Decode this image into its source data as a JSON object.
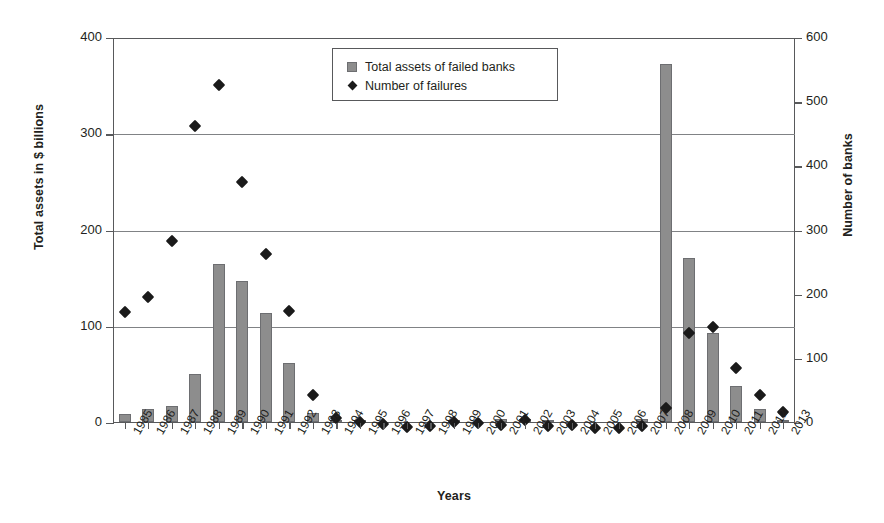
{
  "chart_data": {
    "type": "bar",
    "title": "",
    "xlabel": "Years",
    "ylabel": "Total assets in $ billions",
    "ylabel_right": "Number of banks",
    "ylim": [
      0,
      400
    ],
    "ylim_right": [
      0,
      600
    ],
    "yticks": [
      0,
      100,
      200,
      300,
      400
    ],
    "yticks_right": [
      0,
      100,
      200,
      300,
      400,
      500,
      600
    ],
    "grid": true,
    "legend_position": "top-center",
    "categories": [
      "1985",
      "1986",
      "1987",
      "1988",
      "1989",
      "1990",
      "1991",
      "1992",
      "1993",
      "1994",
      "1995",
      "1996",
      "1997",
      "1998",
      "1999",
      "2000",
      "2001",
      "2002",
      "2003",
      "2004",
      "2005",
      "2006",
      "2007",
      "2008",
      "2009",
      "2010",
      "2011",
      "2012",
      "2013"
    ],
    "series": [
      {
        "name": "Total assets of failed banks",
        "type": "bar",
        "axis": "left",
        "units": "$ billions",
        "color": "#8d8d8d",
        "values": [
          8,
          13,
          16,
          49,
          164,
          146,
          113,
          61,
          9,
          2,
          1,
          0.2,
          0.2,
          0.3,
          1.5,
          0.4,
          2.3,
          2.5,
          1.1,
          0.2,
          0.03,
          0.1,
          2.6,
          372,
          170,
          92,
          37,
          13,
          2
        ]
      },
      {
        "name": "Number of failures",
        "type": "scatter",
        "axis": "right",
        "units": "banks",
        "color": "#1a1a1a",
        "marker": "diamond",
        "values": [
          180,
          204,
          291,
          470,
          534,
          382,
          271,
          181,
          50,
          15,
          8,
          6,
          1,
          3,
          8,
          7,
          4,
          11,
          3,
          4,
          0,
          0,
          3,
          30,
          148,
          157,
          92,
          51,
          24
        ]
      }
    ]
  },
  "axes": {
    "left": {
      "title": "Total assets in $ billions",
      "tick_labels": [
        "0",
        "100",
        "200",
        "300",
        "400"
      ]
    },
    "right": {
      "title": "Number of banks",
      "tick_labels": [
        "0",
        "100",
        "200",
        "300",
        "400",
        "500",
        "600"
      ]
    },
    "bottom": {
      "title": "Years"
    }
  },
  "legend": {
    "entries": [
      {
        "label": "Total assets of failed banks",
        "marker": "square-swatch"
      },
      {
        "label": "Number of failures",
        "marker": "diamond-marker"
      }
    ]
  }
}
